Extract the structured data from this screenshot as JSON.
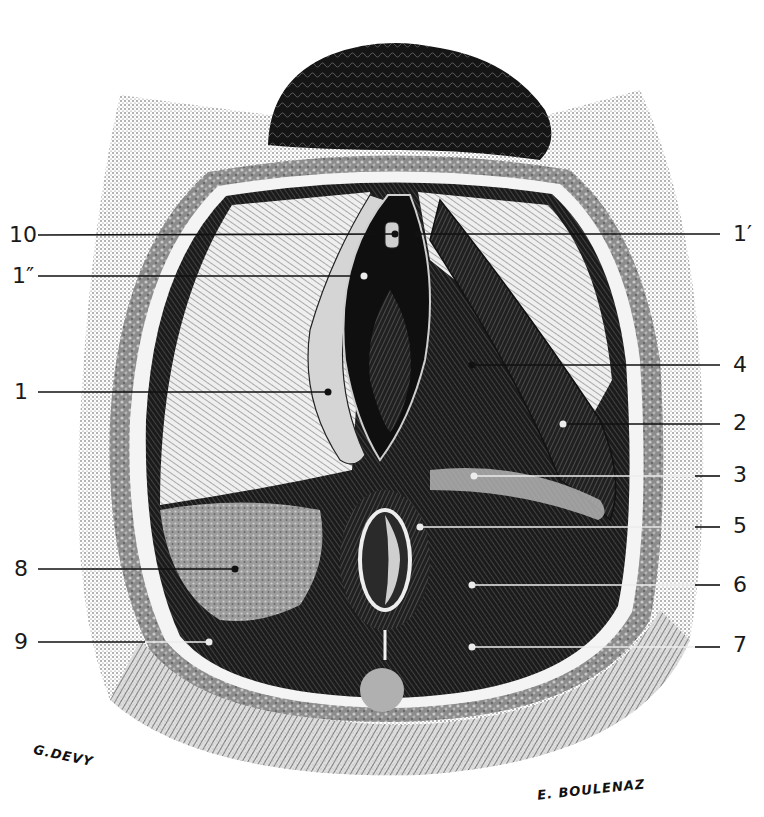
{
  "figure": {
    "type": "engraved anatomical illustration",
    "colors": {
      "ink": "#111111",
      "paper": "#ffffff",
      "mid": "#6a6a6a",
      "fat": "#9a9a9a"
    }
  },
  "labels": {
    "left": [
      {
        "id": "10",
        "text": "10",
        "y": 235,
        "target": [
          395,
          234
        ],
        "line": "dark"
      },
      {
        "id": "1pp",
        "text": "1″",
        "y": 276,
        "target": [
          364,
          276
        ],
        "line": "dark"
      },
      {
        "id": "1",
        "text": "1",
        "y": 392,
        "target": [
          328,
          392
        ],
        "line": "dark"
      },
      {
        "id": "8",
        "text": "8",
        "y": 569,
        "target": [
          235,
          569
        ],
        "line": "dark"
      },
      {
        "id": "9",
        "text": "9",
        "y": 642,
        "target": [
          209,
          642
        ],
        "line": "light"
      }
    ],
    "right": [
      {
        "id": "1p",
        "text": "1′",
        "y": 234,
        "target": [
          418,
          234
        ],
        "line": "dark"
      },
      {
        "id": "4",
        "text": "4",
        "y": 365,
        "target": [
          472,
          365
        ],
        "line": "dark"
      },
      {
        "id": "2",
        "text": "2",
        "y": 423,
        "target": [
          563,
          424
        ],
        "line": "dark"
      },
      {
        "id": "3",
        "text": "3",
        "y": 475,
        "target": [
          474,
          476
        ],
        "line": "light"
      },
      {
        "id": "5",
        "text": "5",
        "y": 526,
        "target": [
          420,
          527
        ],
        "line": "light"
      },
      {
        "id": "6",
        "text": "6",
        "y": 585,
        "target": [
          472,
          585
        ],
        "line": "light"
      },
      {
        "id": "7",
        "text": "7",
        "y": 645,
        "target": [
          472,
          647
        ],
        "line": "light"
      }
    ]
  },
  "signatures": {
    "draughtsman": "G.DEVY",
    "engraver": "E. BOULENAZ"
  }
}
